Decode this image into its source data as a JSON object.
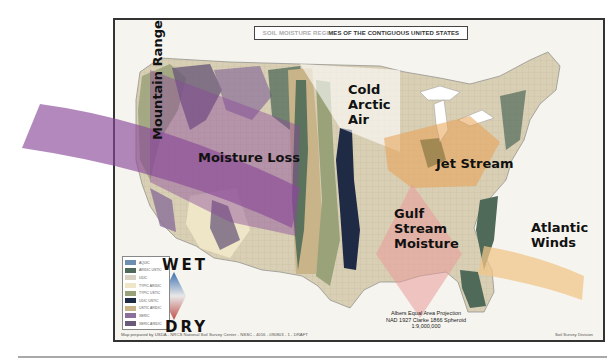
{
  "map": {
    "title_faint": "SOIL MOISTURE REGI",
    "title_bold": "MES OF THE CONTIGUOUS UNITED STATES",
    "title_full": "SOIL MOISTURE REGIMES OF THE CONTIGUOUS UNITED STATES",
    "credit": "Map prepared by USDA - NRCS National Soil Survey Center - NSSC - 4016 - 090803 - 1 - DRAFT",
    "division": "Soil Survey Division",
    "projection": {
      "line1": "Albers Equal Area Projection",
      "line2": "NAD 1927 Clarke 1866 Spheroid",
      "line3": "1:9,000,000"
    }
  },
  "annotations": {
    "mountain_range": "Mountain Range",
    "moisture_loss": "Moisture Loss",
    "cold_arctic_air": [
      "Cold",
      "Arctic",
      "Air"
    ],
    "jet_stream": "Jet Stream",
    "gulf_stream": [
      "Gulf",
      "Stream",
      "Moisture"
    ],
    "atlantic_winds": [
      "Atlantic",
      "Winds"
    ]
  },
  "scale": {
    "wet_label": "WET",
    "dry_label": "DRY"
  },
  "legend": {
    "items": [
      {
        "label": "AQUIC",
        "color": "#6f8fb0"
      },
      {
        "label": "ARIDIC USTIC",
        "color": "#4f6a58"
      },
      {
        "label": "UDIC",
        "color": "#d8d2c2"
      },
      {
        "label": "TYPIC ARIDIC",
        "color": "#efe6c8"
      },
      {
        "label": "TYPIC USTIC",
        "color": "#9aa27a"
      },
      {
        "label": "UDIC USTIC",
        "color": "#1f2a44"
      },
      {
        "label": "USTIC ARIDIC",
        "color": "#c9b48a"
      },
      {
        "label": "XERIC",
        "color": "#8a6f9a"
      },
      {
        "label": "XERIC ARIDIC",
        "color": "#6a5a7a"
      }
    ]
  },
  "colors": {
    "moisture_loss_band": "#8a4a9a",
    "cold_air": "#ffffff",
    "jet_stream": "#e8a050",
    "gulf_stream": "#e99a9a",
    "atlantic_winds": "#f0c68a",
    "land_base": "#d9cfb4"
  }
}
